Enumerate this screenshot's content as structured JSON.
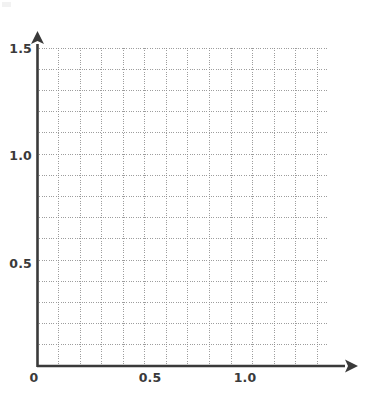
{
  "figure": {
    "title": "",
    "background_color": "#ffffff",
    "width": 367,
    "height": 397
  },
  "axes": {
    "origin_label": "0",
    "x_axis": {
      "name": "x-axis",
      "label": "",
      "color": "#3a3a3a",
      "arrow": true,
      "pixel_start_x": 37,
      "pixel_end_x": 350,
      "pixel_y": 366
    },
    "y_axis": {
      "name": "y-axis",
      "label": "",
      "color": "#3a3a3a",
      "arrow": true,
      "pixel_bottom_y": 366,
      "pixel_top_y": 38,
      "pixel_x": 37
    }
  },
  "grid": {
    "style": "dotted",
    "color": "#8c8c8c",
    "minor_step": 0.1,
    "x_min": 0.0,
    "x_max": 1.35,
    "y_min": 0.0,
    "y_max": 1.5,
    "left_px": 37,
    "right_px": 328,
    "top_px": 48,
    "bottom_px": 366
  },
  "chart_data": {
    "type": "scatter",
    "title": "",
    "xlabel": "",
    "ylabel": "",
    "series": [
      {
        "name": "empty",
        "x": [],
        "y": []
      }
    ],
    "x": [],
    "values": [],
    "categories": [],
    "xlim": [
      0.0,
      1.35
    ],
    "ylim": [
      0.0,
      1.5
    ],
    "grid": true,
    "grid_style": "dotted",
    "grid_minor_step": 0.1,
    "legend": null,
    "legend_position": "none",
    "annotations": [],
    "x_ticks": [
      {
        "value": 0.0,
        "label": "0",
        "px": 34
      },
      {
        "value": 0.5,
        "label": "0.5",
        "px": 150
      },
      {
        "value": 1.0,
        "label": "1.0",
        "px": 245
      }
    ],
    "y_ticks": [
      {
        "value": 0.5,
        "label": "0.5",
        "px": 263
      },
      {
        "value": 1.0,
        "label": "1.0",
        "px": 155
      },
      {
        "value": 1.5,
        "label": "1.5",
        "px": 48
      }
    ]
  },
  "ticks": {
    "x": [
      {
        "label": "0"
      },
      {
        "label": "0.5"
      },
      {
        "label": "1.0"
      }
    ],
    "y": [
      {
        "label": "1.5"
      },
      {
        "label": "1.0"
      },
      {
        "label": "0.5"
      }
    ]
  }
}
